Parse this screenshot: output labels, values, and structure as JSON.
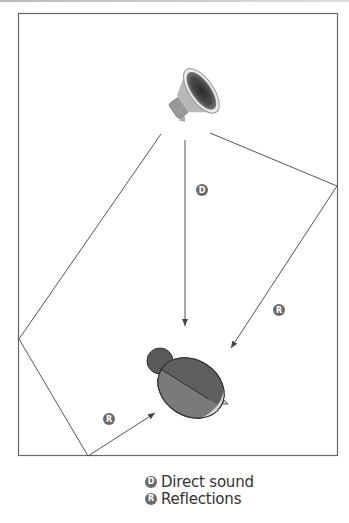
{
  "diagram": {
    "room": {
      "x": 18,
      "y": 13,
      "width": 320,
      "height": 443
    },
    "speaker": {
      "label": "speaker-icon"
    },
    "listener": {
      "label": "listener-head"
    },
    "paths": [
      {
        "type": "direct",
        "badge": "D"
      },
      {
        "type": "reflection",
        "badge": "R"
      },
      {
        "type": "reflection",
        "badge": "R"
      }
    ],
    "colors": {
      "line": "#555555",
      "badge": "#6b6b6b",
      "head_dark": "#5a5a5a",
      "head_mid": "#7a7a7a",
      "face": "#d8d8d8"
    }
  },
  "legend": {
    "items": [
      {
        "badge": "D",
        "label": "Direct sound"
      },
      {
        "badge": "R",
        "label": "Reflections"
      }
    ]
  }
}
